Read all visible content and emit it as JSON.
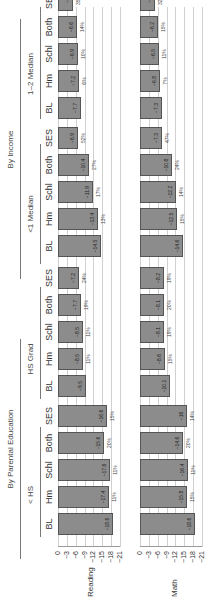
{
  "chart_data": {
    "type": "bar",
    "orientation": "rotated-90-ccw",
    "groups": [
      {
        "name": "By Parental Education",
        "subgroups": [
          "< HS",
          "HS Grad"
        ]
      },
      {
        "name": "By Income",
        "subgroups": [
          "<1 Median",
          "1–2 Median"
        ]
      }
    ],
    "categories": [
      "BL",
      "Hm",
      "Schl",
      "Both",
      "SES"
    ],
    "yaxis": {
      "ticks": [
        "0",
        "−3",
        "−6",
        "−9",
        "−12",
        "−15",
        "−18",
        "−21"
      ],
      "ylim": [
        -21,
        0
      ]
    },
    "rows": [
      {
        "label": "Reading",
        "panels": [
          {
            "subgroup": "< HS",
            "values": [
              -18.6,
              -17.4,
              -17.6,
              -15.6,
              -16.6
            ],
            "pcts": [
              "",
              "11%",
              "11%",
              "20%",
              "15%"
            ]
          },
          {
            "subgroup": "HS Grad",
            "values": [
              -9.5,
              -8.5,
              -8.5,
              -7.7,
              -7.2
            ],
            "pcts": [
              "",
              "11%",
              "11%",
              "19%",
              "24%"
            ]
          },
          {
            "subgroup": "<1 Median",
            "values": [
              -14.5,
              -13.4,
              -11.9,
              -10.4,
              -6.9
            ],
            "pcts": [
              "",
              "13%",
              "17%",
              "27%",
              "52%"
            ]
          },
          {
            "subgroup": "1–2 Median",
            "values": [
              -7.7,
              -7.2,
              -6.9,
              -6.6,
              -5.0
            ],
            "pcts": [
              "",
              "6%",
              "10%",
              "14%",
              "35%"
            ]
          }
        ]
      },
      {
        "label": "Math",
        "panels": [
          {
            "subgroup": "< HS",
            "values": [
              -18.6,
              -15.8,
              -16.4,
              -14.6,
              -16.0
            ],
            "pcts": [
              "",
              "15%",
              "11%",
              "20%",
              "14%"
            ]
          },
          {
            "subgroup": "HS Grad",
            "values": [
              -10.1,
              -8.6,
              -8.1,
              -8.1,
              -8.2
            ],
            "pcts": [
              "",
              "15%",
              "19%",
              "20%",
              "19%"
            ]
          },
          {
            "subgroup": "<1 Median",
            "values": [
              -14.6,
              -12.5,
              -12.2,
              -10.8,
              -7.3
            ],
            "pcts": [
              "",
              "15%",
              "14%",
              "24%",
              "47%"
            ]
          },
          {
            "subgroup": "1–2 Median",
            "values": [
              -7.3,
              -6.8,
              -6.5,
              -6.2,
              -5.0
            ],
            "pcts": [
              "",
              "7%",
              "11%",
              "15%",
              "32%"
            ]
          }
        ]
      }
    ],
    "title": "",
    "xlabel": "",
    "ylabel": ""
  },
  "labels": {
    "group_parent_ed": "By Parental Education",
    "group_income": "By Income",
    "sub_lt_hs": "< HS",
    "sub_hs_grad": "HS Grad",
    "sub_lt1_median": "<1 Median",
    "sub_1_2_median": "1–2 Median",
    "row_reading": "Reading",
    "row_math": "Math",
    "categories": [
      "BL",
      "Hm",
      "Schl",
      "Both",
      "SES"
    ],
    "ticks": [
      "0",
      "−3",
      "−6",
      "−9",
      "−12",
      "−15",
      "−18",
      "−21"
    ]
  }
}
